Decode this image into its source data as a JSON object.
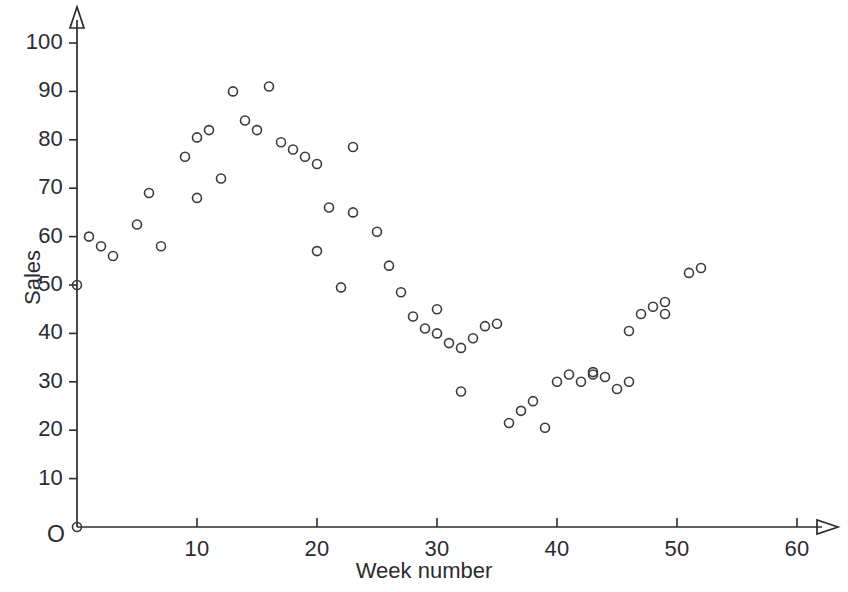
{
  "chart_data": {
    "type": "scatter",
    "title": "",
    "xlabel": "Week number",
    "ylabel": "Sales",
    "xlim": [
      0,
      62
    ],
    "ylim": [
      0,
      103
    ],
    "grid": false,
    "legend": null,
    "origin_label": "O",
    "x_ticks": [
      10,
      20,
      30,
      40,
      50,
      60
    ],
    "x_tick_labels": [
      "10",
      "20",
      "30",
      "40",
      "50",
      "60"
    ],
    "y_ticks": [
      10,
      20,
      30,
      40,
      50,
      60,
      70,
      80,
      90,
      100
    ],
    "y_tick_labels": [
      "10",
      "20",
      "30",
      "40",
      "50",
      "60",
      "70",
      "80",
      "90",
      "100"
    ],
    "marker": {
      "shape": "open-circle",
      "radius": 4.5,
      "stroke": "#3a3a42",
      "stroke_width": 1.6,
      "fill": "none"
    },
    "axis_color": "#2b2b31",
    "points": [
      {
        "x": 0,
        "y": 0
      },
      {
        "x": 0,
        "y": 50
      },
      {
        "x": 1,
        "y": 60
      },
      {
        "x": 2,
        "y": 58
      },
      {
        "x": 3,
        "y": 56
      },
      {
        "x": 5,
        "y": 62.5
      },
      {
        "x": 6,
        "y": 69
      },
      {
        "x": 7,
        "y": 58
      },
      {
        "x": 9,
        "y": 76.5
      },
      {
        "x": 10,
        "y": 80.5
      },
      {
        "x": 10,
        "y": 68
      },
      {
        "x": 11,
        "y": 82
      },
      {
        "x": 12,
        "y": 72
      },
      {
        "x": 13,
        "y": 90
      },
      {
        "x": 14,
        "y": 84
      },
      {
        "x": 15,
        "y": 82
      },
      {
        "x": 16,
        "y": 91
      },
      {
        "x": 17,
        "y": 79.5
      },
      {
        "x": 18,
        "y": 78
      },
      {
        "x": 19,
        "y": 76.5
      },
      {
        "x": 20,
        "y": 75
      },
      {
        "x": 20,
        "y": 57
      },
      {
        "x": 21,
        "y": 66
      },
      {
        "x": 22,
        "y": 49.5
      },
      {
        "x": 23,
        "y": 78.5
      },
      {
        "x": 23,
        "y": 65
      },
      {
        "x": 25,
        "y": 61
      },
      {
        "x": 26,
        "y": 54
      },
      {
        "x": 27,
        "y": 48.5
      },
      {
        "x": 28,
        "y": 43.5
      },
      {
        "x": 29,
        "y": 41
      },
      {
        "x": 30,
        "y": 40
      },
      {
        "x": 30,
        "y": 45
      },
      {
        "x": 31,
        "y": 38
      },
      {
        "x": 32,
        "y": 37
      },
      {
        "x": 32,
        "y": 28
      },
      {
        "x": 33,
        "y": 39
      },
      {
        "x": 34,
        "y": 41.5
      },
      {
        "x": 35,
        "y": 42
      },
      {
        "x": 36,
        "y": 21.5
      },
      {
        "x": 37,
        "y": 24
      },
      {
        "x": 38,
        "y": 26
      },
      {
        "x": 39,
        "y": 20.5
      },
      {
        "x": 40,
        "y": 30
      },
      {
        "x": 41,
        "y": 31.5
      },
      {
        "x": 42,
        "y": 30
      },
      {
        "x": 43,
        "y": 32
      },
      {
        "x": 43,
        "y": 31.5
      },
      {
        "x": 44,
        "y": 31
      },
      {
        "x": 45,
        "y": 28.5
      },
      {
        "x": 46,
        "y": 30
      },
      {
        "x": 46,
        "y": 40.5
      },
      {
        "x": 47,
        "y": 44
      },
      {
        "x": 48,
        "y": 45.5
      },
      {
        "x": 49,
        "y": 44
      },
      {
        "x": 49,
        "y": 46.5
      },
      {
        "x": 51,
        "y": 52.5
      },
      {
        "x": 52,
        "y": 53.5
      }
    ]
  },
  "geometry": {
    "origin_px": {
      "x": 77,
      "y": 527
    },
    "x_scale_px_per_unit": 12.0,
    "y_scale_px_per_unit": 4.84
  }
}
